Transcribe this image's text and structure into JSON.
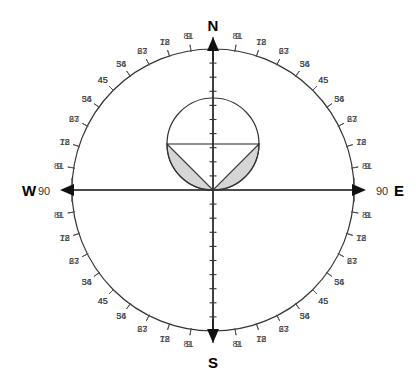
{
  "figure": {
    "title": "",
    "background_color": "#ffffff",
    "line_color": "#222222",
    "axis_color": "#111111",
    "shade_fill": "#d5d5d5",
    "shade_stroke": "#3a3a3a",
    "tick_label_color": "#444444"
  },
  "cardinals": {
    "north": {
      "label": "N",
      "degree": ""
    },
    "south": {
      "label": "S",
      "degree": ""
    },
    "east": {
      "label": "E",
      "degree": "90"
    },
    "west": {
      "label": "W",
      "degree": "90"
    }
  },
  "chart_data": {
    "type": "scatter",
    "title": "",
    "xlabel": "",
    "ylabel": "",
    "projection": "stereonet-polar",
    "outer_circle": {
      "cx": 213,
      "cy": 190,
      "r": 141
    },
    "inner_circle": {
      "cx": 213,
      "cy": 144,
      "r": 46
    },
    "tick_interval_degrees": 9,
    "tick_labels": [
      "9",
      "18",
      "27",
      "36",
      "45",
      "54",
      "63",
      "72",
      "81",
      "90"
    ],
    "tick_label_values": [
      9,
      18,
      27,
      36,
      45,
      54,
      63,
      72,
      81,
      90
    ],
    "quadrant_count": 4,
    "axis_tick_count_per_arm": 9,
    "legend": [],
    "annotations": [
      {
        "name": "inner-circle-chord",
        "description": "horizontal chord through inner circle center"
      },
      {
        "name": "lune-left",
        "description": "shaded crescent lower-left of inner circle"
      },
      {
        "name": "lune-right",
        "description": "shaded crescent lower-right of inner circle"
      }
    ],
    "series": [
      {
        "name": "outer-primitive-circle",
        "values": [
          141
        ]
      },
      {
        "name": "inner-circle",
        "values": [
          46
        ]
      },
      {
        "name": "shaded-lunes",
        "values": [
          2
        ]
      }
    ],
    "grid": false,
    "legend_position": "none"
  }
}
